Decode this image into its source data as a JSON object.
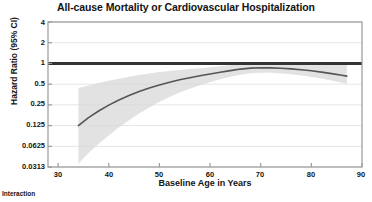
{
  "chart_data": {
    "type": "line",
    "title": "All-cause Mortality or Cardiovascular Hospitalization",
    "xlabel": "Baseline Age in Years",
    "ylabel": "Hazard Ratio (95% CI)",
    "yscale": "log2",
    "xlim": [
      28,
      90
    ],
    "ylim": [
      0.0313,
      4
    ],
    "grid": true,
    "legend": false,
    "xticks": [
      30,
      40,
      50,
      60,
      70,
      80,
      90
    ],
    "xtick_labels": [
      "30",
      "40",
      "50",
      "60",
      "70",
      "80",
      "90"
    ],
    "yticks": [
      4,
      2,
      1,
      0.5,
      0.25,
      0.125,
      0.0625,
      0.0313
    ],
    "ytick_labels": [
      "4",
      "2",
      "1",
      "0.5",
      "0.25",
      "0.125",
      "0.0625",
      "0.0313"
    ],
    "reference_line": {
      "y": 1,
      "label": "null-effect-line",
      "color": "#333333",
      "width": 3
    },
    "series": [
      {
        "name": "Hazard Ratio",
        "color": "#555555",
        "x": [
          34,
          36,
          38,
          40,
          42,
          44,
          46,
          48,
          50,
          52,
          54,
          56,
          58,
          60,
          62,
          64,
          66,
          68,
          70,
          72,
          74,
          76,
          78,
          80,
          82,
          84,
          86,
          87
        ],
        "values": [
          0.125,
          0.163,
          0.204,
          0.248,
          0.295,
          0.343,
          0.392,
          0.44,
          0.487,
          0.533,
          0.578,
          0.621,
          0.663,
          0.704,
          0.744,
          0.786,
          0.828,
          0.856,
          0.866,
          0.862,
          0.85,
          0.833,
          0.81,
          0.782,
          0.748,
          0.712,
          0.675,
          0.655
        ]
      }
    ],
    "confidence_band": {
      "name": "95% CI",
      "color": "#d8d8d8",
      "opacity": 0.75,
      "x": [
        34,
        36,
        38,
        40,
        42,
        44,
        46,
        48,
        50,
        52,
        54,
        56,
        58,
        60,
        62,
        64,
        66,
        68,
        70,
        72,
        74,
        76,
        78,
        80,
        82,
        84,
        86,
        87
      ],
      "lower": [
        0.035,
        0.05,
        0.068,
        0.09,
        0.118,
        0.15,
        0.188,
        0.23,
        0.277,
        0.326,
        0.377,
        0.43,
        0.483,
        0.537,
        0.59,
        0.64,
        0.686,
        0.718,
        0.732,
        0.73,
        0.717,
        0.697,
        0.67,
        0.638,
        0.602,
        0.563,
        0.524,
        0.503
      ],
      "upper": [
        0.44,
        0.48,
        0.52,
        0.56,
        0.6,
        0.64,
        0.678,
        0.714,
        0.748,
        0.778,
        0.806,
        0.83,
        0.852,
        0.88,
        0.91,
        0.944,
        0.98,
        1.01,
        1.03,
        1.04,
        1.045,
        1.048,
        1.05,
        1.05,
        1.048,
        1.045,
        1.04,
        1.035
      ]
    },
    "annotations": [
      "Interaction"
    ]
  },
  "footnote": {
    "text": "Interaction"
  }
}
